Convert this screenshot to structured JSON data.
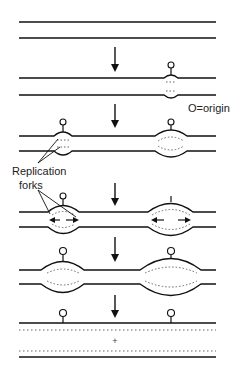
{
  "diagram": {
    "labels": {
      "origin_legend": "O=origin",
      "forks_line1": "Replication",
      "forks_line2": "forks",
      "origin_marker": "O",
      "plus": "+"
    },
    "stages": [
      {
        "id": 1,
        "description": "Unreplicated double-stranded DNA"
      },
      {
        "id": 2,
        "description": "Replication begins at one origin"
      },
      {
        "id": 3,
        "description": "Bubbles open at two origins"
      },
      {
        "id": 4,
        "description": "Replication forks move bidirectionally"
      },
      {
        "id": 5,
        "description": "Bubbles enlarge"
      },
      {
        "id": 6,
        "description": "Two daughter DNA molecules"
      }
    ],
    "colors": {
      "line": "#111111",
      "dotted": "#666666",
      "background": "#ffffff"
    }
  }
}
